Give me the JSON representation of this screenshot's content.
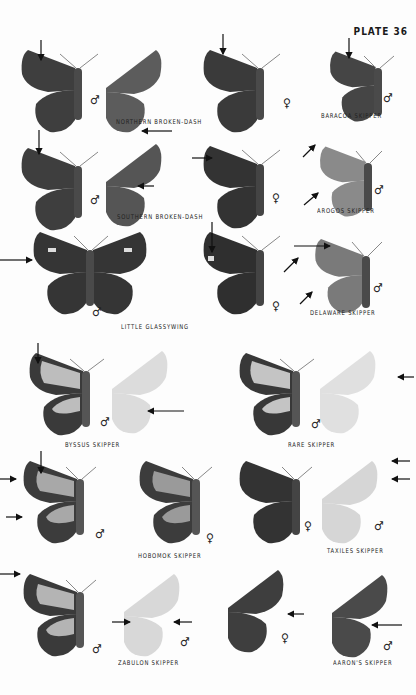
{
  "plate": {
    "title": "PLATE 36"
  },
  "symbols": {
    "male": "♂",
    "female": "♀"
  },
  "colors": {
    "dark_wing": "#3a3a3a",
    "medium_wing": "#6a6a6a",
    "light_wing": "#c8c8c8",
    "pale_wing": "#e2e2e2",
    "body": "#4a4a4a",
    "text": "#222222"
  },
  "species": [
    {
      "id": "northern-broken-dash",
      "name": "NORTHERN BROKEN-DASH",
      "figures": [
        "male upperside",
        "male underside",
        "female upperside"
      ]
    },
    {
      "id": "baracoa-skipper",
      "name": "BARACOA SKIPPER",
      "figures": [
        "male upperside"
      ]
    },
    {
      "id": "southern-broken-dash",
      "name": "SOUTHERN BROKEN-DASH",
      "figures": [
        "male upperside",
        "male underside"
      ]
    },
    {
      "id": "southern-broken-dash-female",
      "name": "",
      "figures": [
        "female upperside"
      ]
    },
    {
      "id": "arogos-skipper",
      "name": "AROGOS SKIPPER",
      "figures": [
        "male upperside"
      ]
    },
    {
      "id": "little-glassywing",
      "name": "LITTLE GLASSYWING",
      "figures": [
        "male upperside",
        "male underside",
        "female upperside"
      ]
    },
    {
      "id": "delaware-skipper",
      "name": "DELAWARE SKIPPER",
      "figures": [
        "male upperside"
      ]
    },
    {
      "id": "byssus-skipper",
      "name": "BYSSUS SKIPPER",
      "figures": [
        "male upperside",
        "male underside"
      ]
    },
    {
      "id": "rare-skipper",
      "name": "RARE SKIPPER",
      "figures": [
        "male upperside",
        "male underside"
      ]
    },
    {
      "id": "hobomok-skipper",
      "name": "HOBOMOK SKIPPER",
      "figures": [
        "male upperside",
        "female upperside"
      ]
    },
    {
      "id": "taxiles-skipper",
      "name": "TAXILES SKIPPER",
      "figures": [
        "female upperside",
        "male underside"
      ]
    },
    {
      "id": "zabulon-skipper",
      "name": "ZABULON SKIPPER",
      "figures": [
        "male upperside",
        "male underside",
        "female upperside"
      ]
    },
    {
      "id": "aarons-skipper",
      "name": "AARON'S SKIPPER",
      "figures": [
        "male underside"
      ]
    }
  ]
}
